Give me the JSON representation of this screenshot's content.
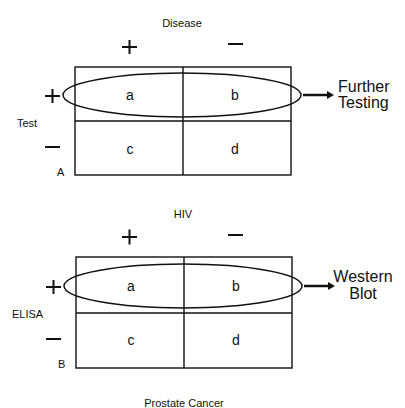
{
  "colors": {
    "ink": "#111111",
    "background": "#ffffff"
  },
  "panels": [
    {
      "id": "A",
      "panel_label": "A",
      "column_header": "Disease",
      "row_header": "Test",
      "column_signs": [
        "+",
        "−"
      ],
      "row_signs": [
        "+",
        "−"
      ],
      "cells": [
        "a",
        "b",
        "c",
        "d"
      ],
      "highlighted_row": "+",
      "outcome": [
        "Further",
        "Testing"
      ]
    },
    {
      "id": "B",
      "panel_label": "B",
      "column_header": "HIV",
      "row_header": "ELISA",
      "column_signs": [
        "+",
        "−"
      ],
      "row_signs": [
        "+",
        "−"
      ],
      "cells": [
        "a",
        "b",
        "c",
        "d"
      ],
      "highlighted_row": "+",
      "outcome": [
        "Western",
        "Blot"
      ]
    }
  ],
  "footer_caption": "Prostate Cancer"
}
